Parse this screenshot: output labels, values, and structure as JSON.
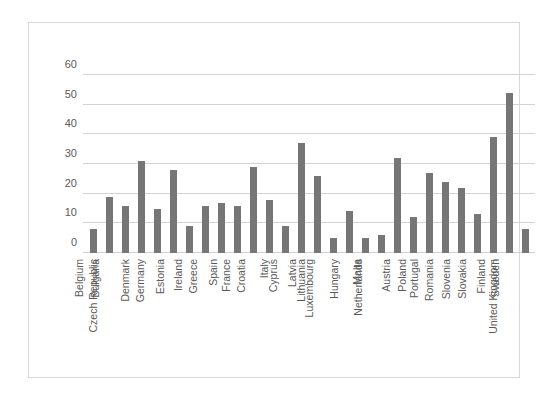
{
  "chart_data": {
    "type": "bar",
    "title": "",
    "subtitle": "",
    "xlabel": "",
    "ylabel": "",
    "ylim": [
      0,
      60
    ],
    "yticks": [
      0,
      10,
      20,
      30,
      40,
      50,
      60
    ],
    "grid": true,
    "legend": false,
    "legend_position": "none",
    "bar_color": "#767676",
    "gridline_color": "#d3d3d3",
    "axis_text_color": "#5a5a5a",
    "categories": [
      "Belgium",
      "Bulgaria",
      "Czech Republic",
      "Denmark",
      "Germany",
      "Estonia",
      "Ireland",
      "Greece",
      "Spain",
      "France",
      "Croatia",
      "Italy",
      "Cyprus",
      "Latvia",
      "Lithuania",
      "Luxembourg",
      "Hungary",
      "Malta",
      "Netherlands",
      "Austria",
      "Poland",
      "Portugal",
      "Romania",
      "Slovenia",
      "Slovakia",
      "Finland",
      "Sweden",
      "United Kingdom"
    ],
    "values": [
      8,
      19,
      16,
      31,
      15,
      28,
      9,
      16,
      17,
      16,
      29,
      18,
      9,
      37,
      26,
      5,
      14,
      5,
      6,
      32,
      12,
      27,
      24,
      22,
      13,
      39,
      54,
      8
    ]
  }
}
